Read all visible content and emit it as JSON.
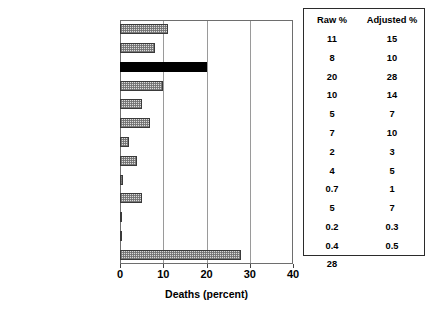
{
  "chart_data": {
    "type": "bar",
    "orientation": "horizontal",
    "title": "CAUSES OF RESIDENTIAL FIRE DEATHS",
    "xlabel": "Deaths (percent)",
    "ylabel": "",
    "xlim": [
      0,
      40
    ],
    "xticks": [
      0,
      10,
      20,
      30,
      40
    ],
    "xtick_labels": [
      "0",
      "10",
      "20",
      "30",
      "40"
    ],
    "grid": true,
    "grid_axis": "x",
    "legend": false,
    "categories": [
      "Incendiary/Suspicious",
      "Children Playing",
      "Smoking",
      "Heating",
      "Cooking",
      "Electrical Distribution",
      "Appliance",
      "Open Flame",
      "Other Heat",
      "Other Equipment",
      "Natural",
      "Exposure",
      "Unknown"
    ],
    "values": [
      11,
      8,
      20,
      10,
      5,
      7,
      2,
      4,
      0.7,
      5,
      0.2,
      0.4,
      28
    ],
    "series": [
      {
        "name": "Raw %",
        "values": [
          11,
          8,
          20,
          10,
          5,
          7,
          2,
          4,
          0.7,
          5,
          0.2,
          0.4,
          28
        ]
      },
      {
        "name": "Adjusted %",
        "values": [
          15,
          10,
          28,
          14,
          7,
          10,
          3,
          5,
          1,
          7,
          0.3,
          0.5,
          null
        ]
      }
    ],
    "highlighted_category": "Smoking",
    "bar_fill": "stipple-gray",
    "highlight_fill": "solid-black"
  },
  "table": {
    "headers": [
      "Raw %",
      "Adjusted %"
    ],
    "rows": [
      {
        "raw": "11",
        "adjusted": "15"
      },
      {
        "raw": "8",
        "adjusted": "10"
      },
      {
        "raw": "20",
        "adjusted": "28"
      },
      {
        "raw": "10",
        "adjusted": "14"
      },
      {
        "raw": "5",
        "adjusted": "7"
      },
      {
        "raw": "7",
        "adjusted": "10"
      },
      {
        "raw": "2",
        "adjusted": "3"
      },
      {
        "raw": "4",
        "adjusted": "5"
      },
      {
        "raw": "0.7",
        "adjusted": "1"
      },
      {
        "raw": "5",
        "adjusted": "7"
      },
      {
        "raw": "0.2",
        "adjusted": "0.3"
      },
      {
        "raw": "0.4",
        "adjusted": "0.5"
      },
      {
        "raw": "28",
        "adjusted": ""
      }
    ]
  },
  "colors": {
    "bar_fill": "#dcdcdc",
    "bar_edge": "#3a3a3a",
    "highlight": "#000000",
    "gridline": "#9a9a9a",
    "frame": "#6e6e6e",
    "table_border": "#2b2b2b",
    "table_shadow": "#3c3c3c"
  }
}
